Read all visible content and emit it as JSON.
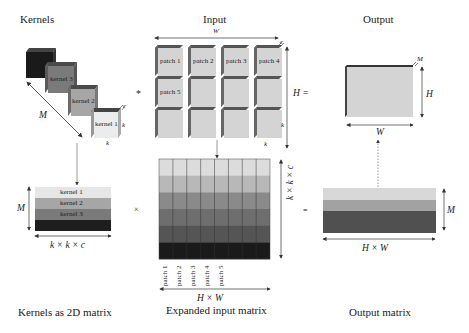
{
  "titles": {
    "kernels": "Kernels",
    "input": "Input",
    "output": "Output",
    "kernels_2d": "Kernels as 2D matrix",
    "expanded": "Expanded input matrix",
    "output_matrix": "Output matrix"
  },
  "kernels": {
    "cubes": [
      {
        "label": "",
        "color": "#1a1a1a"
      },
      {
        "label": "kernel 3",
        "color": "#7a7a7a"
      },
      {
        "label": "kernel 2",
        "color": "#a6a6a6"
      },
      {
        "label": "kernel 1",
        "color": "#e6e6e6"
      }
    ],
    "dim_M": "M",
    "dim_c": "c",
    "dim_k_side": "k",
    "dim_k_bottom": "k"
  },
  "input": {
    "dim_W": "W",
    "dim_c": "c",
    "dim_H": "H",
    "eq": "=",
    "dim_k_side": "k",
    "dim_k_bottom": "k",
    "patches": [
      "patch 1",
      "patch 2",
      "patch 3",
      "patch 4",
      "patch 5",
      "",
      "",
      "",
      "",
      "",
      "",
      ""
    ],
    "convolve": "*"
  },
  "output": {
    "dim_M": "M",
    "dim_H": "H",
    "dim_W": "W",
    "color": "#d4d4d4"
  },
  "kernel_matrix": {
    "rows": [
      {
        "label": "kernel 1",
        "color": "#e6e6e6"
      },
      {
        "label": "kernel 2",
        "color": "#a6a6a6"
      },
      {
        "label": "kernel 3",
        "color": "#7a7a7a"
      },
      {
        "label": "",
        "color": "#1e1e1e"
      }
    ],
    "dim_M": "M",
    "dim_cols": "k × k × c"
  },
  "times": "×",
  "expanded_matrix": {
    "row_colors": [
      "#dcdcdc",
      "#b8b8b8",
      "#8a8a8a",
      "#6e6e6e",
      "#555555",
      "#1a1a1a"
    ],
    "num_cols": 8,
    "col_labels": [
      "patch 1",
      "patch 2",
      "patch 3",
      "patch 4",
      "patch 5"
    ],
    "dim_rows": "k × k × c",
    "dim_cols": "H × W"
  },
  "equals": "=",
  "output_matrix": {
    "row_colors": [
      "#d8d8d8",
      "#a2a2a2",
      "#505050"
    ],
    "dim_M": "M",
    "dim_cols": "H × W"
  }
}
